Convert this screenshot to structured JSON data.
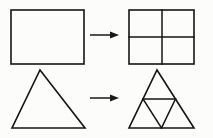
{
  "figure": {
    "background_color": "#fcfcfb",
    "stroke_color": "#141414",
    "arrow_color": "#1a1a1a",
    "canvas": {
      "width": 213,
      "height": 138
    },
    "rows": [
      {
        "id": "rectangle-row",
        "label": "Rectangle divided into four quadrants",
        "source_shape": {
          "name": "rectangle",
          "x": 11,
          "y": 10,
          "width": 73,
          "height": 54,
          "stroke_width": 1.6
        },
        "arrow": {
          "name": "right-arrow",
          "x1": 90,
          "y1": 35,
          "x2": 119,
          "y2": 35,
          "stroke_width": 1.5,
          "head_length": 9,
          "head_half_width": 3.6
        },
        "result_shape": {
          "name": "subdivided-rectangle",
          "x": 129,
          "y": 10,
          "width": 65,
          "height": 54,
          "stroke_width": 1.6,
          "divider_stroke_width": 1.5,
          "vertical_divider_x": 162,
          "horizontal_divider_y": 37,
          "parts": 4
        }
      },
      {
        "id": "triangle-row",
        "label": "Triangle divided into four congruent triangles",
        "source_shape": {
          "name": "triangle",
          "apex_x": 40,
          "apex_y": 70,
          "base_left_x": 12,
          "base_right_x": 85,
          "base_y": 128,
          "stroke_width": 1.6
        },
        "arrow": {
          "name": "right-arrow",
          "x1": 90,
          "y1": 98,
          "x2": 119,
          "y2": 98,
          "stroke_width": 1.5,
          "head_length": 9,
          "head_half_width": 3.6
        },
        "result_shape": {
          "name": "subdivided-triangle",
          "apex_x": 157,
          "apex_y": 70,
          "base_left_x": 129,
          "base_right_x": 194,
          "base_y": 128,
          "stroke_width": 1.6,
          "divider_stroke_width": 1.5,
          "midpoint_left": {
            "x": 143,
            "y": 99
          },
          "midpoint_right": {
            "x": 175.5,
            "y": 99
          },
          "midpoint_base": {
            "x": 161.5,
            "y": 128
          },
          "parts": 4
        }
      }
    ]
  }
}
